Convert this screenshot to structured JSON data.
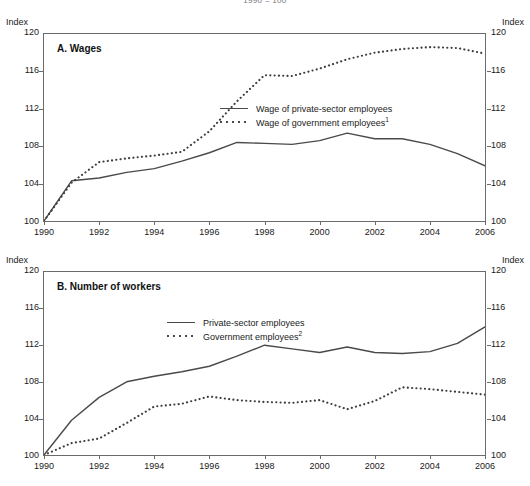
{
  "figure": {
    "subtitle": "1990 = 100"
  },
  "axis": {
    "unit_label": "Index",
    "y_ticks": [
      120,
      116,
      112,
      108,
      104,
      100
    ],
    "y_min": 100,
    "y_max": 120,
    "x_ticks": [
      1990,
      1992,
      1994,
      1996,
      1998,
      2000,
      2002,
      2004,
      2006
    ],
    "x_min": 1990,
    "x_max": 2006
  },
  "panels": [
    {
      "id": "a",
      "title": "A. Wages",
      "legend": [
        {
          "key": "solid",
          "label": "Wage of private-sector employees",
          "note": ""
        },
        {
          "key": "dotted",
          "label": "Wage of government employees",
          "note": "1"
        }
      ]
    },
    {
      "id": "b",
      "title": "B. Number of workers",
      "legend": [
        {
          "key": "solid",
          "label": "Private-sector employees",
          "note": ""
        },
        {
          "key": "dotted",
          "label": "Government employees",
          "note": "2"
        }
      ]
    }
  ],
  "chart_data": [
    {
      "type": "line",
      "title": "A. Wages",
      "xlabel": "",
      "ylabel": "Index",
      "ylim": [
        100,
        120
      ],
      "xlim": [
        1990,
        2006
      ],
      "grid": false,
      "legend_position": "inside-center",
      "x": [
        1990,
        1991,
        1992,
        1993,
        1994,
        1995,
        1996,
        1997,
        1998,
        1999,
        2000,
        2001,
        2002,
        2003,
        2004,
        2005,
        2006
      ],
      "series": [
        {
          "name": "Wage of private-sector employees",
          "style": "solid",
          "values": [
            100.0,
            104.3,
            104.6,
            105.2,
            105.6,
            106.4,
            107.3,
            108.4,
            108.3,
            108.2,
            108.6,
            109.4,
            108.8,
            108.8,
            108.2,
            107.2,
            105.9
          ]
        },
        {
          "name": "Wage of government employees",
          "style": "dotted",
          "note": "1",
          "values": [
            100.0,
            104.1,
            106.3,
            106.7,
            107.0,
            107.4,
            109.6,
            112.8,
            115.6,
            115.5,
            116.3,
            117.3,
            118.0,
            118.4,
            118.6,
            118.5,
            117.9
          ]
        }
      ]
    },
    {
      "type": "line",
      "title": "B. Number of workers",
      "xlabel": "",
      "ylabel": "Index",
      "ylim": [
        100,
        120
      ],
      "xlim": [
        1990,
        2006
      ],
      "grid": false,
      "legend_position": "inside-center",
      "x": [
        1990,
        1991,
        1992,
        1993,
        1994,
        1995,
        1996,
        1997,
        1998,
        1999,
        2000,
        2001,
        2002,
        2003,
        2004,
        2005,
        2006
      ],
      "series": [
        {
          "name": "Private-sector employees",
          "style": "solid",
          "values": [
            100.0,
            103.8,
            106.3,
            108.0,
            108.6,
            109.1,
            109.7,
            110.8,
            112.0,
            111.6,
            111.2,
            111.8,
            111.2,
            111.1,
            111.3,
            112.2,
            114.0
          ]
        },
        {
          "name": "Government employees",
          "style": "dotted",
          "note": "2",
          "values": [
            100.0,
            101.3,
            101.8,
            103.5,
            105.3,
            105.6,
            106.4,
            106.0,
            105.8,
            105.7,
            106.0,
            105.0,
            105.9,
            107.4,
            107.2,
            106.9,
            106.6
          ]
        }
      ]
    }
  ],
  "chart_data_note": "Panel A solid: rises to 1997 peak ~108.7, eases to ~107.8 (1998-2001), then declines steadily to ~100.3 at 2004 and ~100.6 at 2006. Panel A dotted: climbs to ~115.8 by 1996, plateaus, rises to ~118.8 peak at 2001-2002, drops sharply to ~109.5 at 2004, recovers to ~113.6 at 2006."
}
